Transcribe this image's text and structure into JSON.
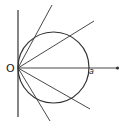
{
  "diagram": {
    "type": "geometry",
    "labels": {
      "origin": "O",
      "point": "a"
    },
    "colors": {
      "stroke": "#333333",
      "background": "#ffffff"
    },
    "elements": {
      "vertical_line": {
        "x": 18,
        "y1": 10,
        "y2": 117
      },
      "circle": {
        "cx": 53.5,
        "cy": 67.5,
        "r": 35.5
      },
      "axis": {
        "x1": 18,
        "y1": 68,
        "x2": 117,
        "y2": 68,
        "arrow_dot": true
      },
      "rays": [
        {
          "x2": 52,
          "y2": 5
        },
        {
          "x2": 94,
          "y2": 21
        },
        {
          "x2": 90,
          "y2": 109
        },
        {
          "x2": 50,
          "y2": 121
        }
      ]
    }
  }
}
